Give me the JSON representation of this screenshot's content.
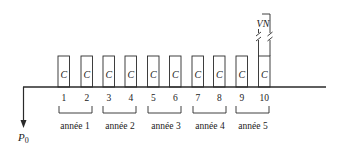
{
  "diagram": {
    "type": "cash-flow timeline",
    "initial_payment_label": "P",
    "initial_payment_subscript": "0",
    "terminal_value_label": "VN",
    "periods": [
      {
        "number": "1",
        "flow": "C"
      },
      {
        "number": "2",
        "flow": "C"
      },
      {
        "number": "3",
        "flow": "C"
      },
      {
        "number": "4",
        "flow": "C"
      },
      {
        "number": "5",
        "flow": "C"
      },
      {
        "number": "6",
        "flow": "C"
      },
      {
        "number": "7",
        "flow": "C"
      },
      {
        "number": "8",
        "flow": "C"
      },
      {
        "number": "9",
        "flow": "C"
      },
      {
        "number": "10",
        "flow": "C"
      }
    ],
    "years": [
      {
        "label": "année 1"
      },
      {
        "label": "année 2"
      },
      {
        "label": "année 3"
      },
      {
        "label": "année 4"
      },
      {
        "label": "année 5"
      }
    ],
    "colors": {
      "stroke": "#2a2a2a",
      "text": "#222222",
      "background": "#ffffff"
    }
  }
}
